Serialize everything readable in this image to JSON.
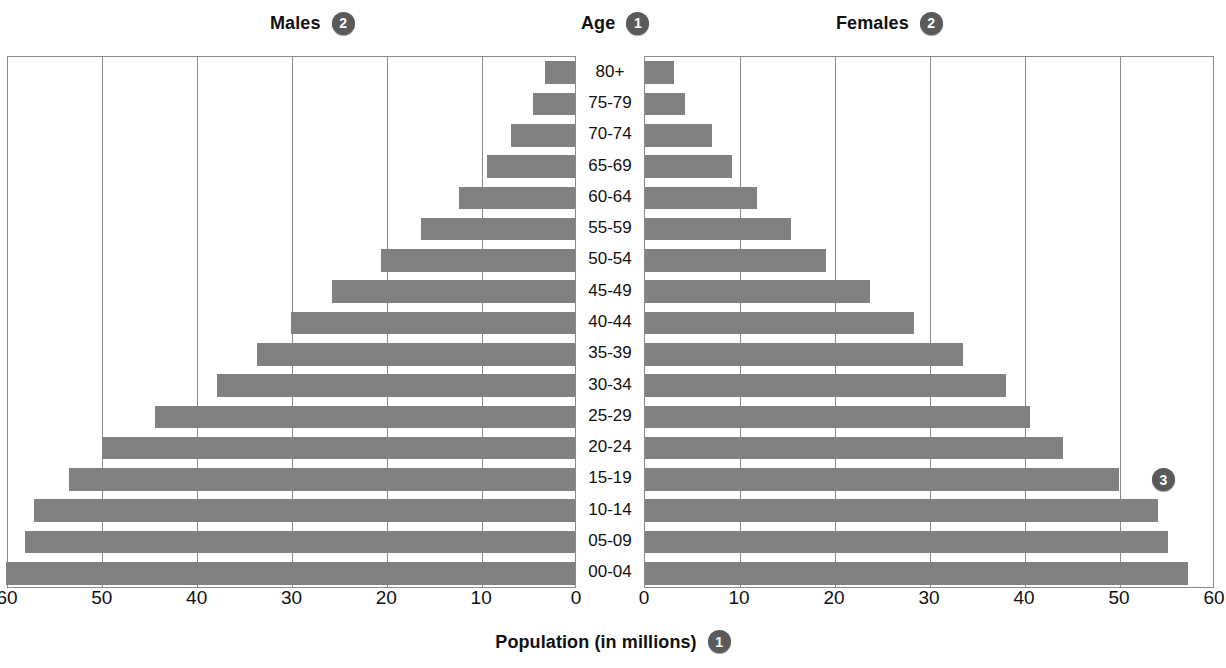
{
  "header": {
    "males_label": "Males",
    "males_badge": "2",
    "age_label": "Age",
    "age_badge": "1",
    "females_label": "Females",
    "females_badge": "2"
  },
  "callouts": {
    "right_badge": "3"
  },
  "axis": {
    "title": "Population (in millions)",
    "title_badge": "1",
    "left_ticks": [
      "60",
      "50",
      "40",
      "30",
      "20",
      "10",
      "0"
    ],
    "right_ticks": [
      "0",
      "10",
      "20",
      "30",
      "40",
      "50",
      "60"
    ]
  },
  "colors": {
    "bar": "#818181",
    "frame": "#8b8b8b",
    "badge": "#5a5a5a",
    "text": "#111111",
    "background": "#ffffff"
  },
  "chart_data": {
    "type": "bar",
    "subtype": "population-pyramid",
    "title": "",
    "xlabel": "Population (in millions)",
    "ylabel": "Age",
    "xlim": [
      0,
      60
    ],
    "xticks": [
      0,
      10,
      20,
      30,
      40,
      50,
      60
    ],
    "grid": true,
    "legend": [
      "Males",
      "Females"
    ],
    "legend_position": "top",
    "categories": [
      "80+",
      "75-79",
      "70-74",
      "65-69",
      "60-64",
      "55-59",
      "50-54",
      "45-49",
      "40-44",
      "35-39",
      "30-34",
      "25-29",
      "20-24",
      "15-19",
      "10-14",
      "05-09",
      "00-04"
    ],
    "series": [
      {
        "name": "Males",
        "direction": "left",
        "values": [
          3.2,
          4.4,
          6.7,
          9.3,
          12.2,
          16.2,
          20.5,
          25.6,
          30.0,
          33.5,
          37.8,
          44.3,
          49.9,
          53.4,
          57.1,
          58.0,
          60.0
        ]
      },
      {
        "name": "Females",
        "direction": "right",
        "values": [
          3.0,
          4.2,
          7.0,
          9.2,
          11.8,
          15.4,
          19.0,
          23.7,
          28.3,
          33.5,
          38.0,
          40.5,
          44.0,
          49.9,
          54.0,
          55.0,
          57.2
        ]
      }
    ]
  }
}
